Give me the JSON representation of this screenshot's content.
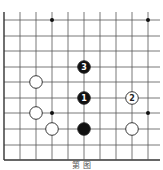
{
  "diagram": {
    "type": "go-board-fragment",
    "grid": {
      "x_lines": [
        4,
        20,
        36,
        52,
        68,
        84,
        100,
        116,
        132,
        148
      ],
      "y_lines": [
        20,
        36,
        51,
        67,
        82,
        98,
        113,
        129,
        145,
        160
      ],
      "left_edge": true,
      "bottom_edge": true,
      "top_extends": true,
      "right_extends": true,
      "line_color": "#555555",
      "edge_color": "#333333"
    },
    "hoshi": [
      {
        "x": 52,
        "y": 20
      },
      {
        "x": 148,
        "y": 20
      },
      {
        "x": 52,
        "y": 113
      },
      {
        "x": 148,
        "y": 113
      }
    ],
    "stones": [
      {
        "color": "black",
        "x": 84,
        "y": 67,
        "label": "3"
      },
      {
        "color": "white",
        "x": 36,
        "y": 82,
        "label": ""
      },
      {
        "color": "black",
        "x": 84,
        "y": 98,
        "label": "1"
      },
      {
        "color": "white",
        "x": 132,
        "y": 98,
        "label": "2"
      },
      {
        "color": "white",
        "x": 36,
        "y": 113,
        "label": ""
      },
      {
        "color": "white",
        "x": 52,
        "y": 129,
        "label": ""
      },
      {
        "color": "black",
        "x": 84,
        "y": 129,
        "label": ""
      },
      {
        "color": "white",
        "x": 132,
        "y": 129,
        "label": ""
      }
    ],
    "caption": "第  图"
  }
}
